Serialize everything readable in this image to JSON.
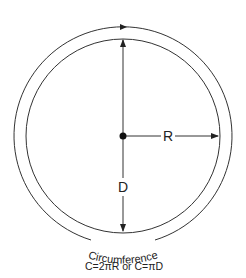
{
  "diagram": {
    "labels": {
      "radius": "R",
      "diameter": "D",
      "circumference": "Circumference",
      "formula": "C=2πR or C=πD"
    },
    "colors": {
      "stroke": "#333333",
      "background": "#ffffff"
    }
  }
}
